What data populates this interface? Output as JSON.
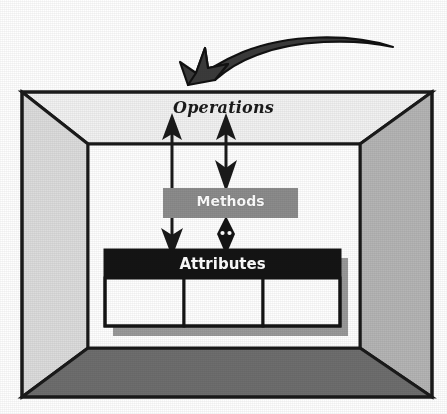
{
  "diagram": {
    "title_label": "Operations",
    "methods_label": "Methods",
    "attributes_label": "Attributes",
    "attribute_cells": [
      "",
      "",
      ""
    ],
    "colors": {
      "outline": "#1a1a1a",
      "ceiling": "#f2f2f2",
      "left_wall": "#dcdcdc",
      "right_wall": "#b5b5b5",
      "floor": "#6e6e6e",
      "back_wall": "#ffffff",
      "methods_box": "#8c8c8c",
      "attributes_header": "#141414",
      "cell_fill": "#ffffff",
      "shadow": "#9a9a9a",
      "arrow": "#1a1a1a",
      "pointer_arrow": "#3b3b3b"
    },
    "icons": {
      "pointer": "curved-arrow-icon",
      "operations_to_attributes": "double-arrow-icon",
      "operations_to_methods": "double-arrow-icon",
      "methods_to_attributes": "double-arrow-icon"
    }
  }
}
